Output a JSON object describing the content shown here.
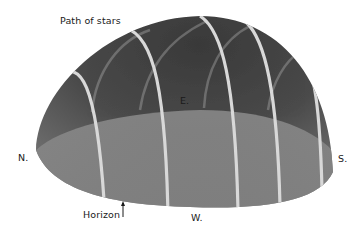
{
  "diagram": {
    "labels": {
      "path_of_stars": "Path of stars",
      "east": "E.",
      "north": "N.",
      "south": "S.",
      "west": "W.",
      "horizon": "Horizon"
    },
    "colors": {
      "dome_dark": "#2a2a2a",
      "dome_mid": "#6a6a6a",
      "horizon_plane": "#8a8a8a",
      "star_path": "#d8d8d8",
      "text": "#1a1a1a",
      "background": "#ffffff"
    }
  }
}
